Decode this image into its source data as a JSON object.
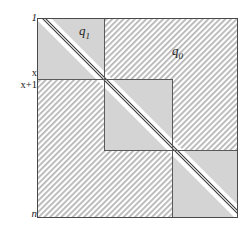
{
  "figure": {
    "colors": {
      "plain_fill": "#d4d4d4",
      "hatch_line": "#a8a8a8",
      "hatch_bg": "#ffffff",
      "border": "#555555",
      "diagonal_line": "#3a3a3a",
      "diagonal_band": "#ffffff",
      "text": "#1a1a1a"
    },
    "square": {
      "left": 37,
      "top": 18,
      "right": 238,
      "bottom": 218
    },
    "dividers": {
      "v1": 104,
      "v2": 172,
      "h1": 79,
      "h2": 150
    },
    "axis_labels": [
      {
        "name": "row-label-1",
        "text": "1",
        "style": "italic",
        "x": 33,
        "y": 18
      },
      {
        "name": "row-label-x",
        "text": "x",
        "style": "upright",
        "x": 33,
        "y": 74
      },
      {
        "name": "row-label-x1",
        "text": "x+1",
        "style": "upright",
        "x": 33,
        "y": 86
      },
      {
        "name": "row-label-n",
        "text": "n",
        "style": "italic",
        "x": 33,
        "y": 214
      }
    ],
    "region_labels": [
      {
        "name": "region-label-q1",
        "base": "q",
        "sub": "1",
        "x": 80,
        "y": 28
      },
      {
        "name": "region-label-q0",
        "base": "q",
        "sub": "0",
        "x": 173,
        "y": 48
      }
    ]
  }
}
